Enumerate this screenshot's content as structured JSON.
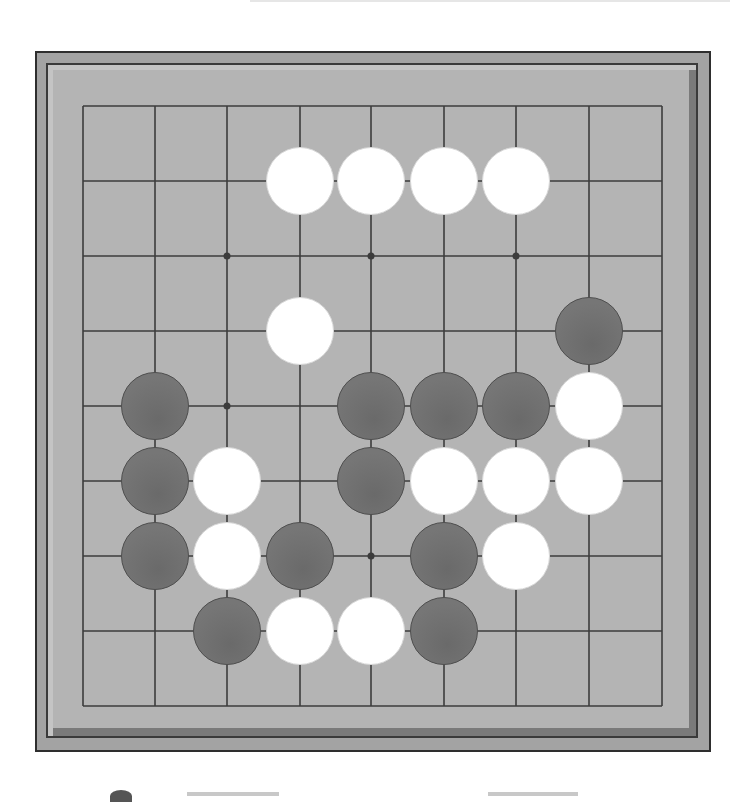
{
  "board": {
    "size": 9,
    "colors": {
      "frame": "#a3a3a3",
      "surface": "#b4b4b4",
      "grid_line": "#3c3c3c",
      "black_stone": "#717171",
      "white_stone": "#ffffff"
    },
    "grid": {
      "x": [
        83,
        155,
        227,
        300,
        371,
        444,
        516,
        589,
        662
      ],
      "y": [
        106,
        181,
        256,
        331,
        406,
        481,
        556,
        631,
        706
      ]
    },
    "star_points": [
      {
        "col": 2,
        "row": 2
      },
      {
        "col": 4,
        "row": 2
      },
      {
        "col": 6,
        "row": 2
      },
      {
        "col": 2,
        "row": 4
      },
      {
        "col": 4,
        "row": 6
      }
    ],
    "stones": [
      {
        "color": "white",
        "col": 3,
        "row": 1
      },
      {
        "color": "white",
        "col": 4,
        "row": 1
      },
      {
        "color": "white",
        "col": 5,
        "row": 1
      },
      {
        "color": "white",
        "col": 6,
        "row": 1
      },
      {
        "color": "white",
        "col": 3,
        "row": 3
      },
      {
        "color": "black",
        "col": 7,
        "row": 3
      },
      {
        "color": "black",
        "col": 1,
        "row": 4
      },
      {
        "color": "black",
        "col": 4,
        "row": 4
      },
      {
        "color": "black",
        "col": 5,
        "row": 4
      },
      {
        "color": "black",
        "col": 6,
        "row": 4
      },
      {
        "color": "white",
        "col": 7,
        "row": 4
      },
      {
        "color": "black",
        "col": 1,
        "row": 5
      },
      {
        "color": "white",
        "col": 2,
        "row": 5
      },
      {
        "color": "black",
        "col": 4,
        "row": 5
      },
      {
        "color": "white",
        "col": 5,
        "row": 5
      },
      {
        "color": "white",
        "col": 6,
        "row": 5
      },
      {
        "color": "white",
        "col": 7,
        "row": 5
      },
      {
        "color": "black",
        "col": 1,
        "row": 6
      },
      {
        "color": "white",
        "col": 2,
        "row": 6
      },
      {
        "color": "black",
        "col": 3,
        "row": 6
      },
      {
        "color": "black",
        "col": 5,
        "row": 6
      },
      {
        "color": "white",
        "col": 6,
        "row": 6
      },
      {
        "color": "black",
        "col": 2,
        "row": 7
      },
      {
        "color": "white",
        "col": 3,
        "row": 7
      },
      {
        "color": "white",
        "col": 4,
        "row": 7
      },
      {
        "color": "black",
        "col": 5,
        "row": 7
      }
    ]
  }
}
